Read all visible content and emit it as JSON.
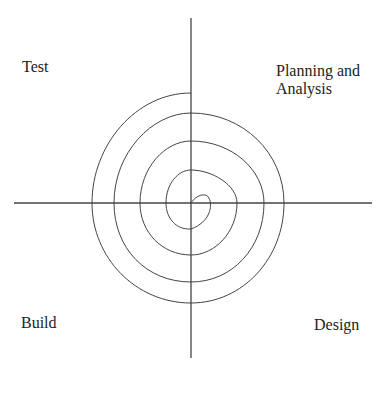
{
  "diagram": {
    "type": "spiral-model",
    "quadrants": {
      "top_left": "Test",
      "top_right_line1": "Planning and",
      "top_right_line2": "Analysis",
      "bottom_left": "Build",
      "bottom_right": "Design"
    },
    "colors": {
      "line": "#333333",
      "background": "#ffffff",
      "text": "#222222"
    }
  }
}
